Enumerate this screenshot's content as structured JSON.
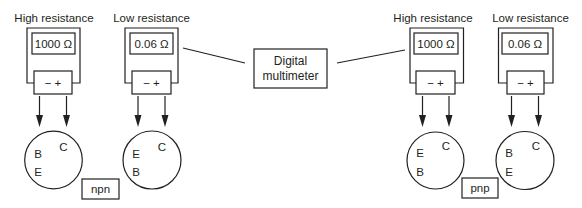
{
  "colors": {
    "stroke": "#231f20",
    "background": "#ffffff"
  },
  "diagram": {
    "center_device": {
      "line1": "Digital",
      "line2": "multimeter"
    },
    "groups": [
      {
        "type_label": "npn",
        "meters": [
          {
            "title": "High resistance",
            "reading": "1000 Ω",
            "polarity": "− +",
            "pins": {
              "upper_left": "B",
              "lower_left": "E",
              "upper_right": "C"
            }
          },
          {
            "title": "Low resistance",
            "reading": "0.06 Ω",
            "polarity": "− +",
            "pins": {
              "upper_left": "E",
              "lower_left": "B",
              "upper_right": "C"
            }
          }
        ]
      },
      {
        "type_label": "pnp",
        "meters": [
          {
            "title": "High resistance",
            "reading": "1000 Ω",
            "polarity": "− +",
            "pins": {
              "upper_left": "E",
              "lower_left": "B",
              "upper_right": "C"
            }
          },
          {
            "title": "Low resistance",
            "reading": "0.06 Ω",
            "polarity": "− +",
            "pins": {
              "upper_left": "B",
              "lower_left": "E",
              "upper_right": "C"
            }
          }
        ]
      }
    ]
  }
}
